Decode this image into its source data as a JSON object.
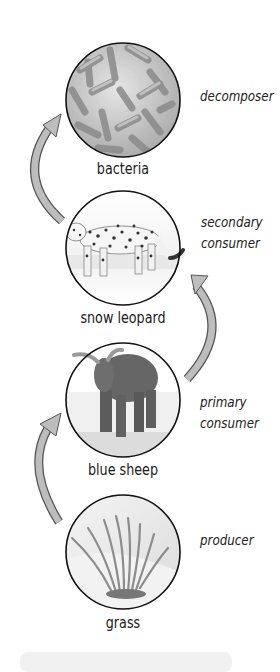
{
  "diagram": {
    "type": "food chain",
    "organisms": [
      {
        "name": "bacteria",
        "role": "decomposer"
      },
      {
        "name": "snow leopard",
        "role_line1": "secondary",
        "role_line2": "consumer"
      },
      {
        "name": "blue sheep",
        "role_line1": "primary",
        "role_line2": "consumer"
      },
      {
        "name": "grass",
        "role": "producer"
      }
    ],
    "arrows": [
      {
        "from": "grass",
        "to": "blue sheep"
      },
      {
        "from": "blue sheep",
        "to": "snow leopard"
      },
      {
        "from": "snow leopard",
        "to": "bacteria"
      }
    ],
    "colors": {
      "arrow_fill": "#b9b9b9",
      "arrow_stroke": "#555555",
      "circle_stroke": "#111111"
    }
  }
}
